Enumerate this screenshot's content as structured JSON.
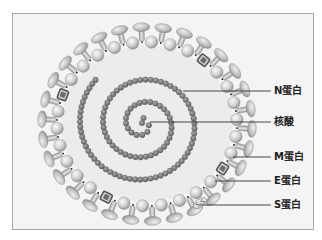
{
  "diagram": {
    "title": "",
    "type": "coronavirus structure",
    "colors": {
      "background": "#f4f4f4",
      "frame": "#a8a8a8",
      "interior": "#ebebeb",
      "bead": "#d2d2d2",
      "bead_highlight": "#f3f3f3",
      "spike": "#bdbdbd",
      "rna": "#8a8a8a",
      "rna_dark": "#666666",
      "e_protein": "#6b6b6b",
      "leader": "#333333"
    },
    "labels": [
      {
        "id": "n-protein",
        "text": "N蛋白",
        "y": 91,
        "line_from_x": 183
      },
      {
        "id": "nucleic-acid",
        "text": "核酸",
        "y": 122,
        "line_from_x": 150
      },
      {
        "id": "m-protein",
        "text": "M蛋白",
        "y": 157,
        "line_from_x": 233
      },
      {
        "id": "e-protein",
        "text": "E蛋白",
        "y": 181,
        "line_from_x": 215
      },
      {
        "id": "s-protein",
        "text": "S蛋白",
        "y": 205,
        "line_from_x": 200
      }
    ],
    "membrane": {
      "cx": 147,
      "cy": 124,
      "rx": 90,
      "ry": 82,
      "bead_count": 30
    },
    "spiral": {
      "cx": 143,
      "cy": 124,
      "turns": 2.6,
      "r_start": 6,
      "r_end": 66,
      "bead_spacing": 5.2
    },
    "ss_label": "S-S"
  }
}
